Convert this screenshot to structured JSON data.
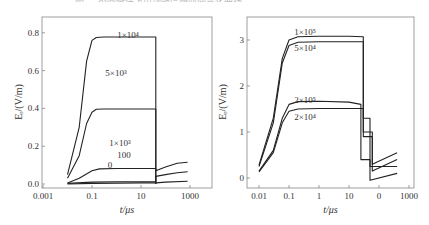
{
  "caption": "图 — 不同条件下电场强度随时间变化曲线",
  "chart_data": [
    {
      "type": "line",
      "panel": "left",
      "xlabel": "t/μs",
      "ylabel": "Eᵣ/(V/m)",
      "xscale": "log",
      "xlim": [
        0.001,
        5000
      ],
      "ylim": [
        -0.02,
        0.82
      ],
      "xticks": [
        "0.001",
        "0.1",
        "10",
        "1000"
      ],
      "yticks": [
        "0.0",
        "0.2",
        "0.4",
        "0.6",
        "0.8"
      ],
      "grid": false,
      "series": [
        {
          "name": "1×10⁴",
          "x": [
            0.01,
            0.03,
            0.06,
            0.1,
            0.15,
            0.3,
            1,
            10,
            40,
            40,
            40
          ],
          "values": [
            0.05,
            0.3,
            0.65,
            0.76,
            0.775,
            0.778,
            0.778,
            0.778,
            0.778,
            0.6,
            0.0
          ]
        },
        {
          "name": "5×10³",
          "x": [
            0.01,
            0.03,
            0.06,
            0.1,
            0.15,
            0.3,
            1,
            10,
            40,
            40
          ],
          "values": [
            0.03,
            0.15,
            0.32,
            0.38,
            0.395,
            0.397,
            0.397,
            0.397,
            0.397,
            0.0
          ]
        },
        {
          "name": "1×10³",
          "x": [
            0.01,
            0.03,
            0.1,
            0.2,
            1,
            10,
            40,
            40,
            100,
            300,
            800
          ],
          "values": [
            0.005,
            0.03,
            0.07,
            0.08,
            0.082,
            0.082,
            0.082,
            0.07,
            0.09,
            0.11,
            0.115
          ]
        },
        {
          "name": "100",
          "x": [
            0.01,
            0.1,
            1,
            10,
            40,
            40,
            100,
            300,
            800
          ],
          "values": [
            0.003,
            0.01,
            0.012,
            0.012,
            0.012,
            0.04,
            0.05,
            0.06,
            0.065
          ]
        },
        {
          "name": "0",
          "x": [
            0.01,
            0.1,
            1,
            10,
            40,
            100,
            800
          ],
          "values": [
            0.0,
            0.003,
            0.005,
            0.006,
            0.006,
            0.01,
            0.015
          ]
        }
      ],
      "annotations": [
        "1×10⁴",
        "5×10³",
        "1×10³",
        "100",
        "0"
      ]
    },
    {
      "type": "line",
      "panel": "right",
      "xlabel": "t/μs",
      "ylabel": "Eᵣ/(V/m)",
      "xscale": "log",
      "xlim": [
        0.005,
        1500
      ],
      "ylim": [
        -0.15,
        3.45
      ],
      "xticks": [
        "0.01",
        "0.1",
        "1",
        "10",
        "0",
        "1000"
      ],
      "yticks": [
        "0",
        "1",
        "2",
        "3"
      ],
      "grid": false,
      "series": [
        {
          "name": "1×10⁵",
          "x": [
            0.01,
            0.03,
            0.06,
            0.1,
            0.2,
            1,
            10,
            30,
            30,
            60,
            60,
            400
          ],
          "values": [
            0.28,
            1.3,
            2.6,
            3.0,
            3.07,
            3.08,
            3.08,
            3.07,
            0.9,
            0.9,
            0.3,
            0.55
          ]
        },
        {
          "name": "5×10⁴",
          "x": [
            0.01,
            0.03,
            0.06,
            0.1,
            0.2,
            1,
            10,
            30,
            30,
            60,
            60,
            400
          ],
          "values": [
            0.25,
            1.2,
            2.5,
            2.88,
            2.95,
            2.96,
            2.96,
            2.96,
            1.0,
            1.0,
            0.15,
            0.4
          ]
        },
        {
          "name": "2×10⁵",
          "x": [
            0.01,
            0.03,
            0.06,
            0.1,
            0.2,
            1,
            10,
            25,
            25,
            50,
            50,
            400
          ],
          "values": [
            0.15,
            0.6,
            1.3,
            1.6,
            1.66,
            1.67,
            1.65,
            1.6,
            0.4,
            0.4,
            0.25,
            0.25
          ]
        },
        {
          "name": "2×10⁴",
          "x": [
            0.01,
            0.03,
            0.06,
            0.1,
            0.2,
            1,
            10,
            30,
            30,
            50,
            50,
            400
          ],
          "values": [
            0.13,
            0.55,
            1.2,
            1.45,
            1.5,
            1.51,
            1.51,
            1.51,
            1.3,
            1.3,
            -0.05,
            0.1
          ]
        }
      ],
      "annotations": [
        "1×10⁵",
        "5×10⁴",
        "2×10⁵",
        "2×10⁴"
      ]
    }
  ]
}
